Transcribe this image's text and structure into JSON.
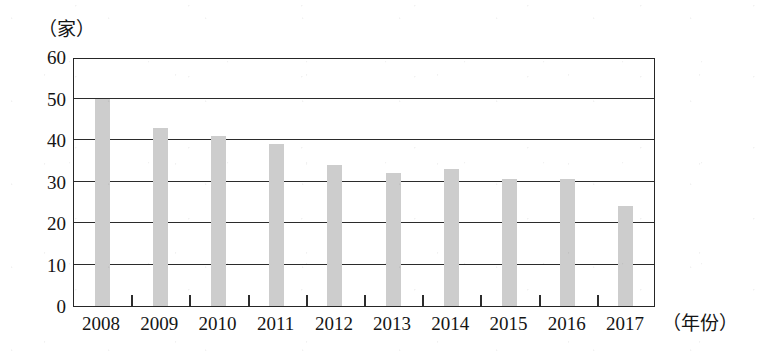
{
  "chart_data": {
    "type": "bar",
    "title": "",
    "subtitle": "",
    "xlabel": "（年份）",
    "ylabel": "（家）",
    "categories": [
      "2008",
      "2009",
      "2010",
      "2011",
      "2012",
      "2013",
      "2014",
      "2015",
      "2016",
      "2017"
    ],
    "values": [
      50,
      43,
      41,
      39,
      34,
      32,
      33,
      30.5,
      30.5,
      24
    ],
    "ylim": [
      0,
      60
    ],
    "y_ticks": [
      0,
      10,
      20,
      30,
      40,
      50,
      60
    ],
    "y_tick_labels": [
      "0",
      "10",
      "20",
      "30",
      "40",
      "50",
      "60"
    ],
    "grid": true,
    "grid_orientation": "horizontal",
    "legend": false,
    "legend_position": "none",
    "bar_color": "#cdcdcd",
    "axis_color": "#262626",
    "text_color": "#151515",
    "background_color": "#ffffff"
  },
  "axes": {
    "y_unit_label": "（家）",
    "x_unit_label": "（年份）"
  }
}
